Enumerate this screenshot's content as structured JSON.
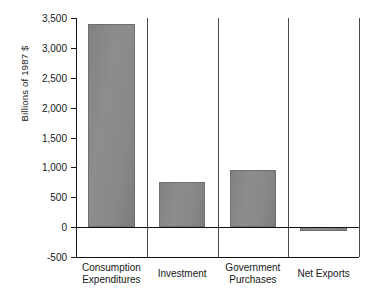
{
  "chart_data": {
    "type": "bar",
    "title": "",
    "subtitle": "",
    "xlabel": "",
    "ylabel": "Billions of 1987 $",
    "categories": [
      "Consumption Expenditures",
      "Investment",
      "Government Purchases",
      "Net Exports"
    ],
    "category_lines": [
      [
        "Consumption",
        "Expenditures"
      ],
      [
        "Investment",
        ""
      ],
      [
        "Government",
        "Purchases"
      ],
      [
        "Net Exports",
        ""
      ]
    ],
    "values": [
      3400,
      750,
      950,
      -60
    ],
    "ylim": [
      -500,
      3500
    ],
    "yticks": [
      3500,
      3000,
      2500,
      2000,
      1500,
      1000,
      500,
      0,
      -500
    ],
    "ytick_labels": [
      "3,500",
      "3,000",
      "2,500",
      "2,000",
      "1,500",
      "1,000",
      "500",
      "0",
      "-500"
    ],
    "grid": false,
    "legend": "none",
    "bar_color": "#888888",
    "bar_edge_color": "#6f6f6f",
    "axis_color": "#111111",
    "separator_color": "#4a4a4a",
    "background": "#ffffff"
  }
}
